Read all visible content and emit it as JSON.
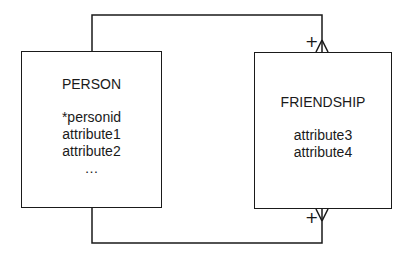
{
  "diagram": {
    "type": "entity-relationship",
    "notation": "crow's foot",
    "entities": [
      {
        "name": "PERSON",
        "attributes": [
          "*personid",
          "attribute1",
          "attribute2",
          "…"
        ]
      },
      {
        "name": "FRIENDSHIP",
        "attributes": [
          "attribute3",
          "attribute4"
        ]
      }
    ],
    "relationships": [
      {
        "from": "PERSON",
        "to": "FRIENDSHIP",
        "route": "top",
        "from_cardinality": "one",
        "to_cardinality": "many",
        "markers": [
          "+",
          "crow-foot"
        ]
      },
      {
        "from": "PERSON",
        "to": "FRIENDSHIP",
        "route": "bottom",
        "from_cardinality": "one",
        "to_cardinality": "many",
        "markers": [
          "+",
          "crow-foot"
        ]
      }
    ],
    "labels": {
      "top_marker": "+",
      "bottom_marker": "+"
    },
    "colors": {
      "line": "#1a1a1a",
      "background": "#ffffff"
    }
  }
}
